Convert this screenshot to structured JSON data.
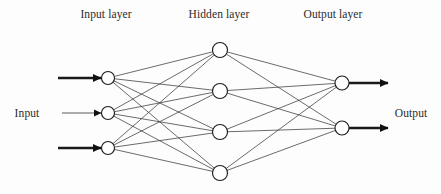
{
  "figure": {
    "kind": "neural-network-architecture-diagram",
    "background_color": "#fdfdfd",
    "ink_color": "#2a2a2a",
    "node_fill": "#ffffff",
    "node_stroke": "#1d1d1d",
    "edge_color": "#3a3a3a",
    "arrow_color": "#111111"
  },
  "titles": {
    "input_layer": "Input layer",
    "hidden_layer": "Hidden layer",
    "output_layer": "Output layer"
  },
  "io_labels": {
    "input": "Input",
    "output": "Output"
  },
  "caption": {
    "text": ""
  },
  "chart_data": {
    "type": "diagram",
    "title": "",
    "layers": [
      {
        "name": "Input layer",
        "label": "Input layer",
        "node_count": 3,
        "x": 108,
        "node_radius": 6.5,
        "nodes": [
          {
            "id": "i1",
            "x": 108,
            "y": 78
          },
          {
            "id": "i2",
            "x": 108,
            "y": 113
          },
          {
            "id": "i3",
            "x": 108,
            "y": 148
          }
        ]
      },
      {
        "name": "Hidden layer",
        "label": "Hidden layer",
        "node_count": 4,
        "x": 220,
        "node_radius": 7.5,
        "nodes": [
          {
            "id": "h1",
            "x": 220,
            "y": 50
          },
          {
            "id": "h2",
            "x": 220,
            "y": 91
          },
          {
            "id": "h3",
            "x": 220,
            "y": 132
          },
          {
            "id": "h4",
            "x": 220,
            "y": 173
          }
        ]
      },
      {
        "name": "Output layer",
        "label": "Output layer",
        "node_count": 2,
        "x": 342,
        "node_radius": 7.0,
        "nodes": [
          {
            "id": "o1",
            "x": 342,
            "y": 83
          },
          {
            "id": "o2",
            "x": 342,
            "y": 128
          }
        ]
      }
    ],
    "connections": [
      {
        "from": "i1",
        "to": "h1"
      },
      {
        "from": "i1",
        "to": "h2"
      },
      {
        "from": "i1",
        "to": "h3"
      },
      {
        "from": "i1",
        "to": "h4"
      },
      {
        "from": "i2",
        "to": "h1"
      },
      {
        "from": "i2",
        "to": "h2"
      },
      {
        "from": "i2",
        "to": "h3"
      },
      {
        "from": "i2",
        "to": "h4"
      },
      {
        "from": "i3",
        "to": "h1"
      },
      {
        "from": "i3",
        "to": "h2"
      },
      {
        "from": "i3",
        "to": "h3"
      },
      {
        "from": "i3",
        "to": "h4"
      },
      {
        "from": "h1",
        "to": "o1"
      },
      {
        "from": "h1",
        "to": "o2"
      },
      {
        "from": "h2",
        "to": "o1"
      },
      {
        "from": "h2",
        "to": "o2"
      },
      {
        "from": "h3",
        "to": "o1"
      },
      {
        "from": "h3",
        "to": "o2"
      },
      {
        "from": "h4",
        "to": "o1"
      },
      {
        "from": "h4",
        "to": "o2"
      }
    ],
    "input_arrows": [
      {
        "id": "in1",
        "x1": 58,
        "x2": 101,
        "y": 78,
        "weight": "strong"
      },
      {
        "id": "in2",
        "x1": 62,
        "x2": 101,
        "y": 113,
        "weight": "weak"
      },
      {
        "id": "in3",
        "x1": 58,
        "x2": 101,
        "y": 148,
        "weight": "strong"
      }
    ],
    "output_arrows": [
      {
        "id": "out1",
        "x1": 349,
        "x2": 388,
        "y": 83,
        "weight": "strong"
      },
      {
        "id": "out2",
        "x1": 349,
        "x2": 388,
        "y": 128,
        "weight": "strong"
      }
    ],
    "fully_connected": true,
    "total_nodes": 9,
    "total_connections": 20,
    "grid": false,
    "legend": null
  }
}
